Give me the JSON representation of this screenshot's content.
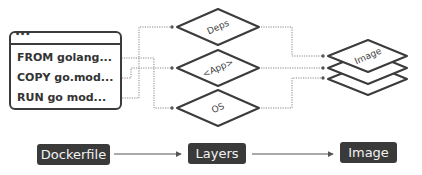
{
  "dockerfile_box": {
    "title_dots": "•••",
    "lines": [
      "FROM golang...",
      "COPY go.mod...",
      "RUN go mod..."
    ]
  },
  "layers": [
    {
      "label": "Deps"
    },
    {
      "label": "<App>"
    },
    {
      "label": "OS"
    }
  ],
  "image_stack": {
    "label": "Image"
  },
  "flow": {
    "steps": [
      "Dockerfile",
      "Layers",
      "Image"
    ]
  },
  "colors": {
    "stroke": "#3b3b3b",
    "pill_bg": "#3a3a3a",
    "pill_text": "#f2f2f2",
    "connector": "#777777"
  }
}
